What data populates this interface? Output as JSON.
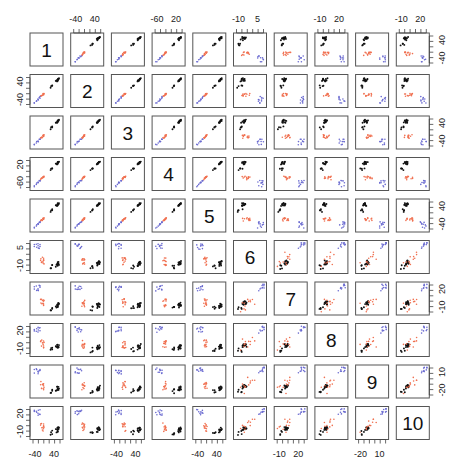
{
  "chart_data": {
    "type": "scatter",
    "subtype": "scatterplot-matrix",
    "title": "",
    "variables": [
      "1",
      "2",
      "3",
      "4",
      "5",
      "6",
      "7",
      "8",
      "9",
      "10"
    ],
    "groups": [
      {
        "name": "group-black",
        "color": "#111111"
      },
      {
        "name": "group-orange",
        "color": "#f07050"
      },
      {
        "name": "group-blue",
        "color": "#6a6ad0"
      }
    ],
    "axis_ticks": {
      "1": {
        "labels": [
          "-40",
          "40"
        ],
        "side": "bottom",
        "col": 1
      },
      "2": {
        "labels": [
          "-40",
          "40"
        ],
        "side": "top/left"
      },
      "3": {
        "labels": [
          "-40",
          "40"
        ],
        "side": "bottom/right"
      },
      "4": {
        "labels": [
          "-60",
          "20"
        ],
        "side": "top/left"
      },
      "5": {
        "labels": [
          "40",
          "-40"
        ],
        "side": "right"
      },
      "6": {
        "labels": [
          "-10",
          "5"
        ],
        "side": "top/left"
      },
      "7": {
        "labels": [
          "-10",
          "20"
        ],
        "side": "bottom/right"
      },
      "8": {
        "labels": [
          "-10",
          "20"
        ],
        "side": "top/left"
      },
      "9": {
        "labels": [
          "-20",
          "10"
        ],
        "side": "bottom/right"
      },
      "10": {
        "labels": [
          "-10",
          "20"
        ],
        "side": "top/left"
      }
    },
    "top_axis_labels": [
      {
        "col": 2,
        "labels": [
          "-40",
          "40"
        ]
      },
      {
        "col": 4,
        "labels": [
          "-60",
          "20"
        ]
      },
      {
        "col": 6,
        "labels": [
          "-10",
          "5"
        ]
      },
      {
        "col": 8,
        "labels": [
          "-10",
          "20"
        ]
      },
      {
        "col": 10,
        "labels": [
          "-10",
          "20"
        ]
      }
    ],
    "bottom_axis_labels": [
      {
        "col": 1,
        "labels": [
          "-40",
          "40"
        ]
      },
      {
        "col": 3,
        "labels": [
          "-40",
          "40"
        ]
      },
      {
        "col": 5,
        "labels": [
          "-40",
          "40"
        ]
      },
      {
        "col": 7,
        "labels": [
          "-10",
          "20"
        ]
      },
      {
        "col": 9,
        "labels": [
          "-20",
          "10"
        ]
      }
    ],
    "left_axis_labels": [
      {
        "row": 2,
        "labels": [
          "40",
          "-40"
        ]
      },
      {
        "row": 4,
        "labels": [
          "20",
          "-60"
        ]
      },
      {
        "row": 6,
        "labels": [
          "5",
          "-10"
        ]
      },
      {
        "row": 8,
        "labels": [
          "20",
          "-10"
        ]
      },
      {
        "row": 10,
        "labels": [
          "20",
          "-10"
        ]
      }
    ],
    "right_axis_labels": [
      {
        "row": 1,
        "labels": [
          "40",
          "-40"
        ]
      },
      {
        "row": 3,
        "labels": [
          "40",
          "-40"
        ]
      },
      {
        "row": 5,
        "labels": [
          "40",
          "-40"
        ]
      },
      {
        "row": 7,
        "labels": [
          "20",
          "-10"
        ]
      },
      {
        "row": 9,
        "labels": [
          "10",
          "-20"
        ]
      }
    ],
    "pattern_notes": {
      "vars_1_to_5": "strongly correlated with each other: points lie on a diagonal line; blue lowest, orange middle, black highest",
      "vars_1_5_vs_6_10": "three clusters: black top-left, orange bottom-left, blue bottom-right (and transposed below diagonal)",
      "vars_6_to_10": "positively correlated: blue at top-right, orange/black along diagonal lower-left"
    },
    "grid": false,
    "legend": null
  }
}
